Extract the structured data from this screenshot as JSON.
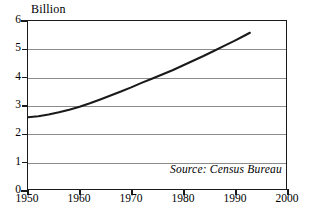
{
  "chart_data": {
    "type": "line",
    "title": "",
    "xlabel": "",
    "ylabel": "Billion",
    "units_label": "Billion",
    "source_note": "Source: Census Bureau",
    "xlim": [
      1950,
      2000
    ],
    "ylim": [
      0,
      6
    ],
    "grid": true,
    "legend": "none",
    "line_color": "#1a1a1a",
    "frame_color": "#1a1a1a",
    "grid_color": "#8c8c8c",
    "x_ticks": [
      1950,
      1960,
      1970,
      1980,
      1990,
      2000
    ],
    "x_tick_labels": [
      "1950",
      "1960",
      "1970",
      "1980",
      "1990",
      "2000"
    ],
    "y_ticks": [
      0,
      1,
      2,
      3,
      4,
      5,
      6
    ],
    "y_tick_labels": [
      "0",
      "1",
      "2",
      "3",
      "4",
      "5",
      "6"
    ],
    "series": [
      {
        "name": "World population",
        "x": [
          1950,
          1952,
          1954,
          1956,
          1958,
          1960,
          1962,
          1964,
          1966,
          1968,
          1970,
          1972,
          1974,
          1976,
          1978,
          1980,
          1982,
          1984,
          1986,
          1988,
          1990,
          1992,
          1993
        ],
        "values": [
          2.56,
          2.6,
          2.66,
          2.74,
          2.83,
          2.94,
          3.06,
          3.2,
          3.34,
          3.48,
          3.63,
          3.79,
          3.94,
          4.09,
          4.24,
          4.41,
          4.58,
          4.75,
          4.93,
          5.11,
          5.29,
          5.48,
          5.58
        ]
      }
    ]
  }
}
